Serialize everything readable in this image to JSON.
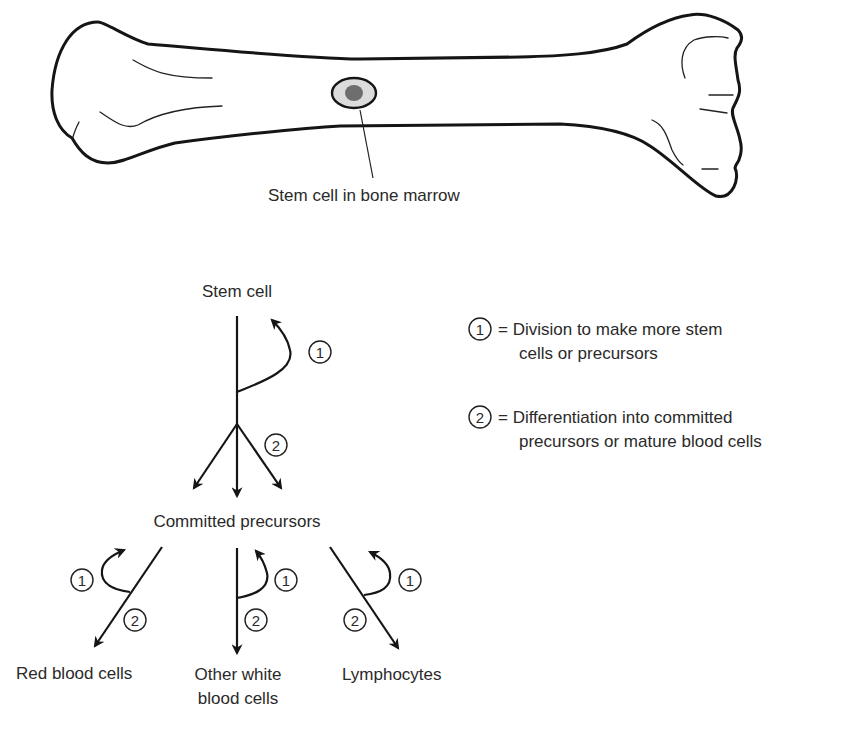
{
  "bone": {
    "label": "Stem cell in bone marrow",
    "colors": {
      "outline": "#151515",
      "cell_ring": "#dcdcdc",
      "cell_nucleus": "#6e6e6e"
    }
  },
  "lineage": {
    "stem_cell_label": "Stem cell",
    "committed_label": "Committed precursors",
    "step_one_marker": "1",
    "step_two_marker": "2",
    "outcomes": [
      {
        "label_lines": [
          "Red blood cells"
        ]
      },
      {
        "label_lines": [
          "Other white",
          "blood cells"
        ]
      },
      {
        "label_lines": [
          "Lymphocytes"
        ]
      }
    ]
  },
  "legend": {
    "items": [
      {
        "marker": "1",
        "lines": [
          "= Division to make more stem",
          "cells or precursors"
        ]
      },
      {
        "marker": "2",
        "lines": [
          "= Differentiation into committed",
          "precursors or mature blood cells"
        ]
      }
    ]
  }
}
